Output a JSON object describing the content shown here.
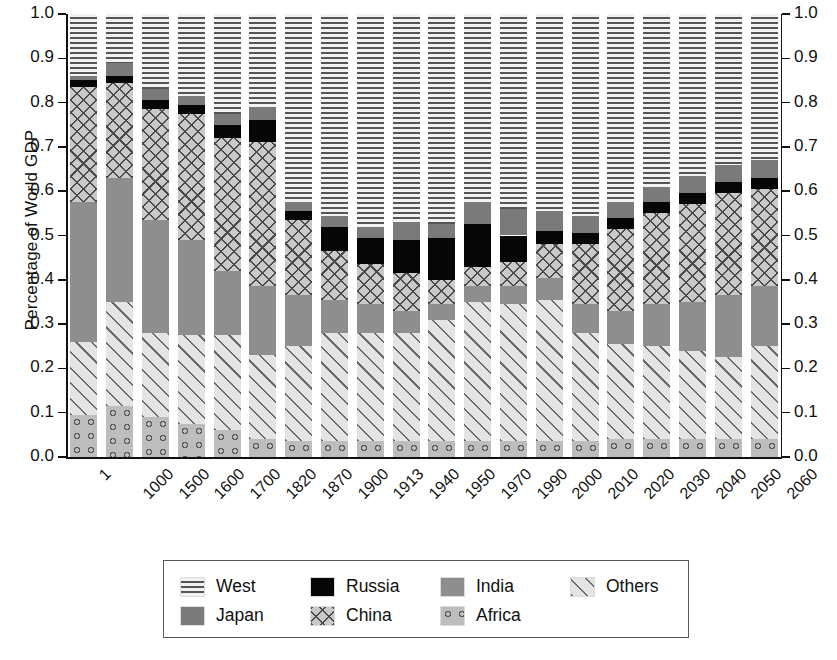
{
  "chart_data": {
    "type": "bar",
    "subtype": "stacked-bar-100pct",
    "title": "",
    "xlabel": "",
    "ylabel": "Percentage of World GDP",
    "ylim": [
      0.0,
      1.0
    ],
    "ytick_labels_left": [
      "1.0",
      "0.9",
      "0.8",
      "0.7",
      "0.6",
      "0.5",
      "0.4",
      "0.3",
      "0.2",
      "0.1",
      "0.0"
    ],
    "ytick_labels_right": [
      "1.0",
      "0.9",
      "0.8",
      "0.7",
      "0.6",
      "0.5",
      "0.4",
      "0.3",
      "0.2",
      "0.1",
      "0.0"
    ],
    "yticks": [
      1.0,
      0.9,
      0.8,
      0.7,
      0.6,
      0.5,
      0.4,
      0.3,
      0.2,
      0.1,
      0.0
    ],
    "grid": false,
    "legend_position": "bottom",
    "categories": [
      "1",
      "1000",
      "1500",
      "1600",
      "1700",
      "1820",
      "1870",
      "1900",
      "1913",
      "1940",
      "1950",
      "1970",
      "1990",
      "2000",
      "2010",
      "2020",
      "2030",
      "2040",
      "2050",
      "2060"
    ],
    "stack_order_bottom_to_top": [
      "Africa",
      "Others",
      "India",
      "China",
      "Russia",
      "Japan",
      "West"
    ],
    "series": [
      {
        "name": "Africa",
        "values": [
          0.095,
          0.115,
          0.09,
          0.075,
          0.06,
          0.04,
          0.035,
          0.035,
          0.035,
          0.035,
          0.035,
          0.035,
          0.035,
          0.035,
          0.035,
          0.04,
          0.04,
          0.04,
          0.04,
          0.04
        ]
      },
      {
        "name": "Others",
        "values": [
          0.165,
          0.235,
          0.19,
          0.2,
          0.215,
          0.19,
          0.215,
          0.245,
          0.245,
          0.245,
          0.275,
          0.315,
          0.31,
          0.32,
          0.245,
          0.215,
          0.21,
          0.2,
          0.185,
          0.21
        ]
      },
      {
        "name": "India",
        "values": [
          0.315,
          0.28,
          0.255,
          0.215,
          0.145,
          0.155,
          0.115,
          0.075,
          0.065,
          0.05,
          0.035,
          0.035,
          0.04,
          0.05,
          0.065,
          0.075,
          0.095,
          0.11,
          0.14,
          0.135
        ]
      },
      {
        "name": "China",
        "values": [
          0.26,
          0.215,
          0.25,
          0.285,
          0.3,
          0.325,
          0.17,
          0.11,
          0.09,
          0.085,
          0.055,
          0.045,
          0.055,
          0.075,
          0.135,
          0.185,
          0.205,
          0.22,
          0.23,
          0.22
        ]
      },
      {
        "name": "Russia",
        "values": [
          0.015,
          0.015,
          0.02,
          0.02,
          0.03,
          0.05,
          0.02,
          0.055,
          0.06,
          0.075,
          0.095,
          0.095,
          0.06,
          0.03,
          0.025,
          0.025,
          0.025,
          0.025,
          0.025,
          0.025
        ]
      },
      {
        "name": "Japan",
        "values": [
          0.01,
          0.03,
          0.025,
          0.02,
          0.025,
          0.03,
          0.02,
          0.025,
          0.025,
          0.04,
          0.03,
          0.05,
          0.06,
          0.045,
          0.04,
          0.035,
          0.035,
          0.04,
          0.04,
          0.04
        ]
      },
      {
        "name": "West",
        "values": [
          0.14,
          0.11,
          0.17,
          0.185,
          0.225,
          0.21,
          0.425,
          0.455,
          0.48,
          0.47,
          0.475,
          0.425,
          0.44,
          0.445,
          0.455,
          0.425,
          0.39,
          0.365,
          0.34,
          0.33
        ]
      }
    ],
    "bar_tops": [
      1.0,
      1.0,
      1.0,
      1.0,
      1.0,
      1.0,
      1.0,
      1.0,
      1.0,
      1.0,
      1.0,
      1.0,
      1.0,
      1.0,
      1.0,
      1.0,
      1.0,
      1.0,
      1.0,
      1.0
    ],
    "annotations": []
  },
  "legend": {
    "items": [
      {
        "label": "West",
        "pattern": "dash-dot-hatch",
        "color": "#f2f2f2"
      },
      {
        "label": "Russia",
        "pattern": "solid-black",
        "color": "#060606"
      },
      {
        "label": "India",
        "pattern": "solid-gray",
        "color": "#8e8e8e"
      },
      {
        "label": "Others",
        "pattern": "diagonal-hatch",
        "color": "#e4e4e4"
      },
      {
        "label": "Japan",
        "pattern": "solid-darkgray",
        "color": "#7a7a7a"
      },
      {
        "label": "China",
        "pattern": "cross-diamond",
        "color": "#c9c9c9"
      },
      {
        "label": "Africa",
        "pattern": "circles",
        "color": "#bdbdbd"
      }
    ]
  }
}
